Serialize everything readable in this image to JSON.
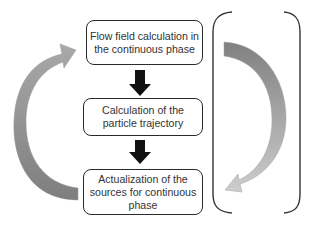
{
  "diagram": {
    "type": "flowchart-cycle",
    "steps": [
      {
        "id": "step-1",
        "lines": [
          "Flow field calculation in",
          "the continuous phase"
        ]
      },
      {
        "id": "step-2",
        "lines": [
          "Calculation of the",
          "particle trajectory"
        ]
      },
      {
        "id": "step-3",
        "lines": [
          "Actualization of the",
          "sources for continuous",
          "phase"
        ]
      }
    ],
    "connectors": [
      {
        "from": "step-1",
        "to": "step-2",
        "style": "solid-black-down-arrow"
      },
      {
        "from": "step-2",
        "to": "step-3",
        "style": "solid-black-down-arrow"
      },
      {
        "from": "step-3",
        "to": "step-1",
        "style": "curved-gray-arrow-left"
      }
    ],
    "bracket": {
      "side": "right",
      "contains": "curved-gray-arrow-down",
      "direction": "top-to-bottom"
    },
    "colors": {
      "box_border": "#2a2a2a",
      "text": "#333333",
      "down_arrow": "#111111",
      "curved_arrow_dark": "#8a8a8a",
      "curved_arrow_light": "#c4c4c4",
      "bracket": "#333333"
    }
  }
}
